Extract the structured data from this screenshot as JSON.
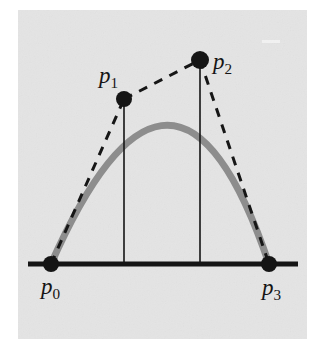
{
  "figure": {
    "type": "geometric-diagram",
    "canvas": {
      "width": 320,
      "height": 351
    },
    "panel": {
      "name": "figure-panel",
      "x": 18,
      "y": 10,
      "width": 289,
      "height": 329,
      "fill": "#e4e4e4"
    },
    "colors": {
      "background": "#ffffff",
      "panel": "#e4e4e4",
      "curve": "#8d8d8d",
      "ink": "#151515",
      "dash": "#161616"
    },
    "baseline": {
      "name": "baseline-segment",
      "x1": 28,
      "y1": 264,
      "x2": 298,
      "y2": 264,
      "stroke_width": 5
    },
    "curve": {
      "name": "bezier-curve",
      "stroke": "#8d8d8d",
      "stroke_width": 7,
      "path": "M 51 264 C 124 99 200 60 269 264",
      "apex_y": 128
    },
    "control_polygon": {
      "name": "control-polygon",
      "dash_pattern": "9 8",
      "stroke_width": 3,
      "segments": [
        {
          "name": "segment-p0-p1",
          "from": "p0",
          "to": "p1"
        },
        {
          "name": "segment-p1-p2",
          "from": "p1",
          "to": "p2"
        },
        {
          "name": "segment-p2-p3",
          "from": "p2",
          "to": "p3"
        }
      ]
    },
    "droplines": [
      {
        "name": "dropline-p1",
        "x": 124,
        "y1": 99,
        "y2": 264,
        "stroke_width": 1.6
      },
      {
        "name": "dropline-p2",
        "x": 200,
        "y1": 60,
        "y2": 264,
        "stroke_width": 1.6
      }
    ],
    "points": [
      {
        "id": "p0",
        "name": "control-point-p0",
        "label": "p",
        "subscript": "0",
        "x": 51,
        "y": 264,
        "radius": 8,
        "label_x": 41,
        "label_y": 294,
        "role": "endpoint"
      },
      {
        "id": "p1",
        "name": "control-point-p1",
        "label": "p",
        "subscript": "1",
        "x": 124,
        "y": 99,
        "radius": 8,
        "label_x": 99,
        "label_y": 83,
        "role": "control"
      },
      {
        "id": "p2",
        "name": "control-point-p2",
        "label": "p",
        "subscript": "2",
        "x": 200,
        "y": 60,
        "radius": 9,
        "label_x": 213,
        "label_y": 69,
        "role": "control"
      },
      {
        "id": "p3",
        "name": "control-point-p3",
        "label": "p",
        "subscript": "3",
        "x": 269,
        "y": 264,
        "radius": 8,
        "label_x": 262,
        "label_y": 295,
        "role": "endpoint"
      }
    ],
    "label_font_size": 23
  }
}
